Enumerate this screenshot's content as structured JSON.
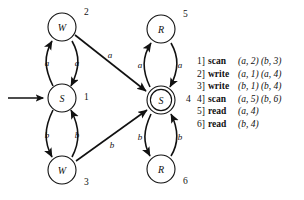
{
  "figure": {
    "type": "state-transition-diagram",
    "title": ""
  },
  "nodes": [
    {
      "id": "n1",
      "letter": "S",
      "index": "1",
      "accepting": false,
      "start": true,
      "cx": 62,
      "cy": 98,
      "r": 14,
      "index_dx": 22,
      "index_dy": 2
    },
    {
      "id": "n2",
      "letter": "W",
      "index": "2",
      "accepting": false,
      "start": false,
      "cx": 62,
      "cy": 27,
      "r": 14,
      "index_dx": 22,
      "index_dy": -12
    },
    {
      "id": "n3",
      "letter": "W",
      "index": "3",
      "accepting": false,
      "start": false,
      "cx": 62,
      "cy": 170,
      "r": 14,
      "index_dx": 22,
      "index_dy": 15
    },
    {
      "id": "n4",
      "letter": "S",
      "index": "4",
      "accepting": true,
      "start": false,
      "cx": 161,
      "cy": 100,
      "r": 14,
      "index_dx": 25,
      "index_dy": 2
    },
    {
      "id": "n5",
      "letter": "R",
      "index": "5",
      "accepting": false,
      "start": false,
      "cx": 161,
      "cy": 29,
      "r": 14,
      "index_dx": 22,
      "index_dy": -12
    },
    {
      "id": "n6",
      "letter": "R",
      "index": "6",
      "accepting": false,
      "start": false,
      "cx": 161,
      "cy": 169,
      "r": 14,
      "index_dx": 22,
      "index_dy": 15
    }
  ],
  "edges": [
    {
      "id": "e_1_2",
      "from": "n1",
      "to": "n2",
      "label": "a",
      "label_x": 47,
      "label_y": 63
    },
    {
      "id": "e_2_1",
      "from": "n2",
      "to": "n1",
      "label": "a",
      "label_x": 77,
      "label_y": 63
    },
    {
      "id": "e_3_1",
      "from": "n3",
      "to": "n1",
      "label": "b",
      "label_x": 77,
      "label_y": 136
    },
    {
      "id": "e_1_3",
      "from": "n1",
      "to": "n3",
      "label": "b",
      "label_x": 47,
      "label_y": 136
    },
    {
      "id": "e_2_4",
      "from": "n2",
      "to": "n4",
      "label": "a",
      "label_x": 110,
      "label_y": 56
    },
    {
      "id": "e_3_4",
      "from": "n3",
      "to": "n4",
      "label": "b",
      "label_x": 112,
      "label_y": 146
    },
    {
      "id": "e_4_5",
      "from": "n4",
      "to": "n5",
      "label": "a",
      "label_x": 141,
      "label_y": 65
    },
    {
      "id": "e_5_4",
      "from": "n5",
      "to": "n4",
      "label": "a",
      "label_x": 177,
      "label_y": 65
    },
    {
      "id": "e_4_6",
      "from": "n4",
      "to": "n6",
      "label": "b",
      "label_x": 141,
      "label_y": 138
    },
    {
      "id": "e_6_4",
      "from": "n6",
      "to": "n4",
      "label": "b",
      "label_x": 177,
      "label_y": 138
    }
  ],
  "start_arrow": {
    "x1": 8,
    "y1": 98,
    "x2": 45,
    "y2": 98
  },
  "legend": {
    "rows": [
      {
        "num": "1]",
        "op": "scan",
        "pairs": "(a, 2) (b, 3)"
      },
      {
        "num": "2]",
        "op": "write",
        "pairs": "(a, 1) (a, 4)"
      },
      {
        "num": "3]",
        "op": "write",
        "pairs": "(b, 1) (b, 4)"
      },
      {
        "num": "4]",
        "op": "scan",
        "pairs": "(a, 5) (b, 6)"
      },
      {
        "num": "5]",
        "op": "read",
        "pairs": "(a, 4)"
      },
      {
        "num": "6]",
        "op": "read",
        "pairs": "(b, 4)"
      }
    ]
  },
  "colors": {
    "ink": "#111111",
    "paper": "#ffffff"
  }
}
